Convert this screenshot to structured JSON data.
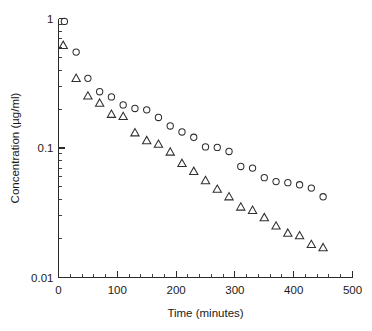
{
  "chart_data": {
    "type": "scatter",
    "title": "",
    "xlabel": "Time (minutes)",
    "ylabel": "Concentration (µg/ml)",
    "xlim": [
      0,
      500
    ],
    "ylim": [
      0.01,
      1
    ],
    "yscale": "log",
    "xscale": "linear",
    "grid": false,
    "legend": "none",
    "xticks": [
      0,
      100,
      200,
      300,
      400,
      500
    ],
    "xticklabels": [
      "0",
      "100",
      "200",
      "300",
      "400",
      "500"
    ],
    "xminor_step": 20,
    "yticks": [
      1,
      0.1,
      0.01
    ],
    "yticklabels": [
      "1",
      "0.1",
      "0.01"
    ],
    "yminor": [
      0.9,
      0.8,
      0.7,
      0.6,
      0.5,
      0.4,
      0.3,
      0.2,
      0.09,
      0.08,
      0.07,
      0.06,
      0.05,
      0.04,
      0.03,
      0.02
    ],
    "series": [
      {
        "name": "circles",
        "marker": "open-circle",
        "color": "#2f2f2f",
        "points": [
          [
            10,
            0.95
          ],
          [
            30,
            0.55
          ],
          [
            50,
            0.345
          ],
          [
            70,
            0.272
          ],
          [
            90,
            0.248
          ],
          [
            110,
            0.215
          ],
          [
            130,
            0.202
          ],
          [
            150,
            0.197
          ],
          [
            170,
            0.172
          ],
          [
            190,
            0.148
          ],
          [
            210,
            0.133
          ],
          [
            230,
            0.121
          ],
          [
            250,
            0.102
          ],
          [
            270,
            0.101
          ],
          [
            290,
            0.094
          ],
          [
            310,
            0.072
          ],
          [
            330,
            0.07
          ],
          [
            350,
            0.059
          ],
          [
            370,
            0.055
          ],
          [
            390,
            0.054
          ],
          [
            410,
            0.052
          ],
          [
            430,
            0.049
          ],
          [
            450,
            0.042
          ]
        ]
      },
      {
        "name": "triangles",
        "marker": "open-triangle",
        "color": "#2f2f2f",
        "points": [
          [
            8,
            0.62
          ],
          [
            30,
            0.345
          ],
          [
            50,
            0.252
          ],
          [
            70,
            0.222
          ],
          [
            90,
            0.182
          ],
          [
            110,
            0.175
          ],
          [
            130,
            0.131
          ],
          [
            150,
            0.114
          ],
          [
            170,
            0.107
          ],
          [
            190,
            0.093
          ],
          [
            210,
            0.076
          ],
          [
            230,
            0.066
          ],
          [
            250,
            0.056
          ],
          [
            270,
            0.048
          ],
          [
            290,
            0.042
          ],
          [
            310,
            0.035
          ],
          [
            330,
            0.033
          ],
          [
            350,
            0.029
          ],
          [
            370,
            0.025
          ],
          [
            390,
            0.022
          ],
          [
            410,
            0.021
          ],
          [
            430,
            0.018
          ],
          [
            450,
            0.017
          ]
        ]
      }
    ]
  }
}
